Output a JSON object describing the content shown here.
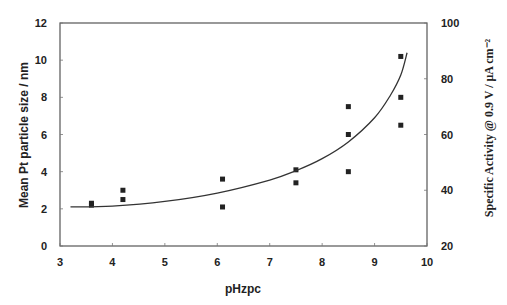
{
  "chart_data": {
    "type": "scatter",
    "title": "",
    "xlabel": "pHzpc",
    "ylabel": "Mean Pt particle size / nm",
    "y2label": "Specific Activity @ 0.9 V / μA cm⁻²",
    "xlim": [
      3,
      10
    ],
    "ylim": [
      0,
      12
    ],
    "y2lim": [
      20,
      100
    ],
    "grid": false,
    "legend": "none",
    "x_ticks": [
      "3",
      "4",
      "5",
      "6",
      "7",
      "8",
      "9",
      "10"
    ],
    "y_ticks": [
      "0",
      "2",
      "4",
      "6",
      "8",
      "10",
      "12"
    ],
    "y2_ticks": [
      "20",
      "40",
      "60",
      "80",
      "100"
    ],
    "series": [
      {
        "name": "Mean Pt particle size",
        "marker": "square",
        "points": [
          {
            "x": 3.6,
            "y": 2.2
          },
          {
            "x": 3.6,
            "y": 2.3
          },
          {
            "x": 4.2,
            "y": 3.0
          },
          {
            "x": 4.2,
            "y": 2.5
          },
          {
            "x": 6.1,
            "y": 3.6
          },
          {
            "x": 6.1,
            "y": 2.1
          },
          {
            "x": 7.5,
            "y": 4.1
          },
          {
            "x": 7.5,
            "y": 3.4
          },
          {
            "x": 8.5,
            "y": 7.5
          },
          {
            "x": 8.5,
            "y": 6.0
          },
          {
            "x": 8.5,
            "y": 4.0
          },
          {
            "x": 9.5,
            "y": 10.2
          },
          {
            "x": 9.5,
            "y": 8.0
          },
          {
            "x": 9.5,
            "y": 6.5
          }
        ]
      },
      {
        "name": "Fit curve",
        "marker": "line",
        "points": [
          {
            "x": 3.2,
            "y": 2.1
          },
          {
            "x": 4.0,
            "y": 2.15
          },
          {
            "x": 5.0,
            "y": 2.4
          },
          {
            "x": 6.0,
            "y": 2.85
          },
          {
            "x": 7.0,
            "y": 3.55
          },
          {
            "x": 7.5,
            "y": 4.05
          },
          {
            "x": 8.0,
            "y": 4.7
          },
          {
            "x": 8.5,
            "y": 5.6
          },
          {
            "x": 9.0,
            "y": 6.9
          },
          {
            "x": 9.3,
            "y": 8.1
          },
          {
            "x": 9.5,
            "y": 9.2
          },
          {
            "x": 9.62,
            "y": 10.4
          }
        ]
      }
    ]
  }
}
